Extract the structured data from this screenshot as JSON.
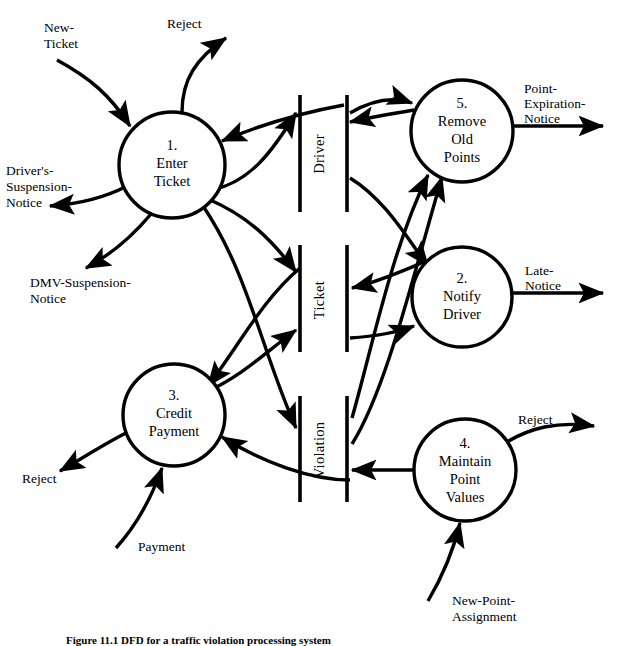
{
  "figure": {
    "type": "data-flow-diagram",
    "caption": "Figure 11.1  DFD for a traffic violation processing system",
    "background_color": "#ffffff",
    "line_color": "#000000"
  },
  "processes": [
    {
      "id": "p1",
      "number": "1.",
      "name_lines": [
        "Enter",
        "Ticket"
      ],
      "cx": 172,
      "cy": 165,
      "r": 53
    },
    {
      "id": "p2",
      "number": "2.",
      "name_lines": [
        "Notify",
        "Driver"
      ],
      "cx": 462,
      "cy": 297,
      "r": 50
    },
    {
      "id": "p3",
      "number": "3.",
      "name_lines": [
        "Credit",
        "Payment"
      ],
      "cx": 174,
      "cy": 415,
      "r": 51
    },
    {
      "id": "p4",
      "number": "4.",
      "name_lines": [
        "Maintain",
        "Point",
        "Values"
      ],
      "cx": 465,
      "cy": 470,
      "r": 51
    },
    {
      "id": "p5",
      "number": "5.",
      "name_lines": [
        "Remove",
        "Old",
        "Points"
      ],
      "cx": 462,
      "cy": 131,
      "r": 51
    }
  ],
  "data_stores": [
    {
      "id": "ds-driver",
      "label": "Driver",
      "x_left": 300,
      "x_right": 347,
      "y_top": 95,
      "y_bottom": 212
    },
    {
      "id": "ds-ticket",
      "label": "Ticket",
      "x_left": 300,
      "x_right": 347,
      "y_top": 245,
      "y_bottom": 352
    },
    {
      "id": "ds-violation",
      "label": "Violation",
      "x_left": 300,
      "x_right": 347,
      "y_top": 396,
      "y_bottom": 502
    }
  ],
  "external_flows": [
    {
      "id": "f-new-ticket",
      "label_lines": [
        "New-",
        "Ticket"
      ],
      "direction": "in",
      "to": "p1",
      "label_x": 44,
      "label_y": 32
    },
    {
      "id": "f-reject-1",
      "label_lines": [
        "Reject"
      ],
      "direction": "out",
      "from": "p1",
      "label_x": 167,
      "label_y": 28
    },
    {
      "id": "f-drivers-suspension-notice",
      "label_lines": [
        "Driver's-",
        "Suspension-",
        "Notice"
      ],
      "direction": "out",
      "from": "p1",
      "label_x": 6,
      "label_y": 175
    },
    {
      "id": "f-dmv-suspension-notice",
      "label_lines": [
        "DMV-Suspension-",
        "Notice"
      ],
      "direction": "out",
      "from": "p1",
      "label_x": 30,
      "label_y": 287
    },
    {
      "id": "f-reject-3",
      "label_lines": [
        "Reject"
      ],
      "direction": "out",
      "from": "p3",
      "label_x": 22,
      "label_y": 483
    },
    {
      "id": "f-payment",
      "label_lines": [
        "Payment"
      ],
      "direction": "in",
      "to": "p3",
      "label_x": 138,
      "label_y": 551
    },
    {
      "id": "f-point-expiration-notice",
      "label_lines": [
        "Point-",
        "Expiration-",
        "Notice"
      ],
      "direction": "out",
      "from": "p5",
      "label_x": 524,
      "label_y": 93
    },
    {
      "id": "f-late-notice",
      "label_lines": [
        "Late-",
        "Notice"
      ],
      "direction": "out",
      "from": "p2",
      "label_x": 525,
      "label_y": 275
    },
    {
      "id": "f-reject-4",
      "label_lines": [
        "Reject"
      ],
      "direction": "out",
      "from": "p4",
      "label_x": 518,
      "label_y": 424
    },
    {
      "id": "f-new-point-assignment",
      "label_lines": [
        "New-Point-",
        "Assignment"
      ],
      "direction": "in",
      "to": "p4",
      "label_x": 452,
      "label_y": 605
    }
  ],
  "internal_flows": [
    {
      "id": "p1-to-driver",
      "from": "p1",
      "to": "ds-driver",
      "direction": "write"
    },
    {
      "id": "driver-to-p1",
      "from": "ds-driver",
      "to": "p1",
      "direction": "read"
    },
    {
      "id": "p1-to-ticket",
      "from": "p1",
      "to": "ds-ticket",
      "direction": "write"
    },
    {
      "id": "driver-to-p5",
      "from": "ds-driver",
      "to": "p5",
      "direction": "read"
    },
    {
      "id": "p5-to-driver",
      "from": "p5",
      "to": "ds-driver",
      "direction": "write"
    },
    {
      "id": "driver-to-p2",
      "from": "ds-driver",
      "to": "p2",
      "direction": "read"
    },
    {
      "id": "ticket-to-p2",
      "from": "ds-ticket",
      "to": "p2",
      "direction": "read"
    },
    {
      "id": "p2-to-ticket",
      "from": "p2",
      "to": "ds-ticket",
      "direction": "write"
    },
    {
      "id": "p3-to-ticket",
      "from": "p3",
      "to": "ds-ticket",
      "direction": "write"
    },
    {
      "id": "violation-to-p5",
      "from": "ds-violation",
      "to": "p5",
      "direction": "read"
    },
    {
      "id": "violation-to-p3",
      "from": "ds-violation",
      "to": "p3",
      "direction": "read"
    },
    {
      "id": "p1-to-violation",
      "from": "p1",
      "to": "ds-violation",
      "direction": "write"
    },
    {
      "id": "p4-to-violation",
      "from": "p4",
      "to": "ds-violation",
      "direction": "write"
    },
    {
      "id": "ticket-to-p3",
      "from": "ds-ticket",
      "to": "p3",
      "direction": "read"
    }
  ]
}
